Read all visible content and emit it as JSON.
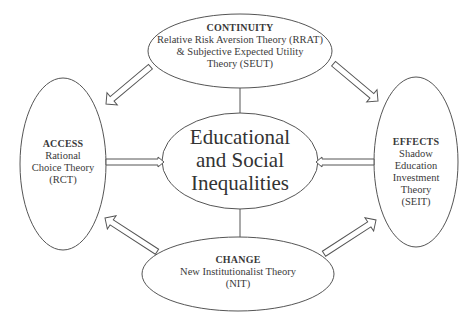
{
  "diagram": {
    "center": {
      "lines": [
        "Educational",
        "and Social",
        "Inequalities"
      ]
    },
    "nodes": {
      "top": {
        "title": "CONTINUITY",
        "lines": [
          "Relative Risk Aversion Theory (RRAT)",
          "& Subjective Expected Utility",
          "Theory (SEUT)"
        ]
      },
      "left": {
        "title": "ACCESS",
        "lines": [
          "Rational",
          "Choice Theory",
          "(RCT)"
        ]
      },
      "right": {
        "title": "EFFECTS",
        "lines": [
          "Shadow",
          "Education",
          "Investment",
          "Theory",
          "(SEIT)"
        ]
      },
      "bottom": {
        "title": "CHANGE",
        "lines": [
          "New Institutionalist Theory",
          "(NIT)"
        ]
      }
    },
    "edges": [
      {
        "from": "top",
        "to": "left",
        "type": "hollow-arrow"
      },
      {
        "from": "top",
        "to": "right",
        "type": "hollow-arrow"
      },
      {
        "from": "bottom",
        "to": "left",
        "type": "hollow-arrow"
      },
      {
        "from": "bottom",
        "to": "right",
        "type": "hollow-arrow"
      },
      {
        "from": "left",
        "to": "center",
        "type": "hollow-arrow"
      },
      {
        "from": "right",
        "to": "center",
        "type": "hollow-arrow"
      },
      {
        "from": "top",
        "to": "center",
        "type": "line"
      },
      {
        "from": "center",
        "to": "bottom",
        "type": "line"
      }
    ],
    "colors": {
      "stroke": "#555555",
      "text": "#3a3a3a",
      "background": "#ffffff"
    }
  }
}
